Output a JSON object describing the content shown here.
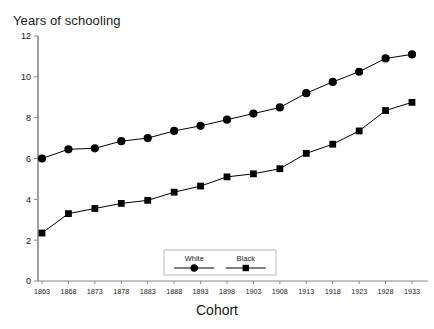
{
  "chart_data": {
    "type": "line",
    "title": "Years of schooling",
    "xlabel": "Cohort",
    "ylabel": "",
    "categories": [
      "1863",
      "1868",
      "1873",
      "1878",
      "1883",
      "1888",
      "1893",
      "1898",
      "1903",
      "1908",
      "1913",
      "1918",
      "1923",
      "1928",
      "1933"
    ],
    "x_tick_labels": [
      "1863",
      "1868",
      "1873",
      "1878",
      "1883",
      "1888",
      "1893",
      "1898",
      "1903",
      "1908",
      "1913",
      "1918",
      "1923",
      "1928",
      "1933"
    ],
    "y_tick_labels": [
      "0",
      "2",
      "4",
      "6",
      "8",
      "10",
      "12"
    ],
    "y_ticks": [
      0,
      2,
      4,
      6,
      8,
      10,
      12
    ],
    "ylim": [
      0,
      12
    ],
    "grid": false,
    "legend_position": "bottom-center-inside",
    "series": [
      {
        "name": "White",
        "marker": "circle",
        "color": "#000000",
        "values": [
          6.0,
          6.45,
          6.5,
          6.85,
          7.0,
          7.35,
          7.6,
          7.9,
          8.2,
          8.5,
          9.2,
          9.75,
          10.25,
          10.9,
          11.1
        ]
      },
      {
        "name": "Black",
        "marker": "square",
        "color": "#000000",
        "values": [
          2.35,
          3.3,
          3.55,
          3.8,
          3.95,
          4.35,
          4.65,
          5.1,
          5.25,
          5.5,
          6.25,
          6.7,
          7.35,
          8.35,
          8.75
        ]
      }
    ]
  },
  "legend": {
    "entries": [
      {
        "label": "White",
        "marker": "circle"
      },
      {
        "label": "Black",
        "marker": "square"
      }
    ]
  },
  "axes": {
    "title_text": "Years of schooling",
    "x_axis_title": "Cohort"
  }
}
